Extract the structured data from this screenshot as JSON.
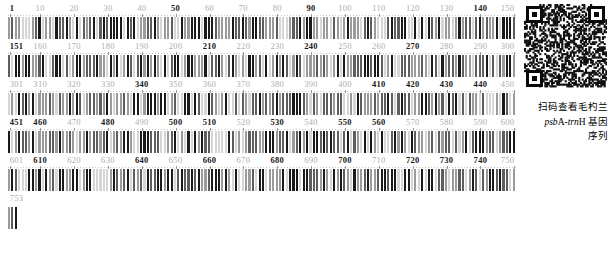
{
  "figure": {
    "type": "dna-barcode-sequence",
    "sequence_length": 754,
    "bases_per_row": 150,
    "rows": [
      {
        "start": 1,
        "end": 150,
        "ticks": [
          {
            "v": "1",
            "pos": 1,
            "strong": true
          },
          {
            "v": "10",
            "pos": 10,
            "strong": false
          },
          {
            "v": "20",
            "pos": 20,
            "strong": false
          },
          {
            "v": "30",
            "pos": 30,
            "strong": false
          },
          {
            "v": "40",
            "pos": 40,
            "strong": false
          },
          {
            "v": "50",
            "pos": 50,
            "strong": true
          },
          {
            "v": "60",
            "pos": 60,
            "strong": false
          },
          {
            "v": "70",
            "pos": 70,
            "strong": false
          },
          {
            "v": "80",
            "pos": 80,
            "strong": false
          },
          {
            "v": "90",
            "pos": 90,
            "strong": true
          },
          {
            "v": "100",
            "pos": 100,
            "strong": false
          },
          {
            "v": "110",
            "pos": 110,
            "strong": false
          },
          {
            "v": "120",
            "pos": 120,
            "strong": false
          },
          {
            "v": "130",
            "pos": 130,
            "strong": false
          },
          {
            "v": "140",
            "pos": 140,
            "strong": true
          },
          {
            "v": "150",
            "pos": 150,
            "strong": false
          }
        ]
      },
      {
        "start": 151,
        "end": 300,
        "ticks": [
          {
            "v": "151",
            "pos": 1,
            "strong": true
          },
          {
            "v": "160",
            "pos": 10,
            "strong": false
          },
          {
            "v": "170",
            "pos": 20,
            "strong": false
          },
          {
            "v": "180",
            "pos": 30,
            "strong": false
          },
          {
            "v": "190",
            "pos": 40,
            "strong": false
          },
          {
            "v": "200",
            "pos": 50,
            "strong": false
          },
          {
            "v": "210",
            "pos": 60,
            "strong": true
          },
          {
            "v": "220",
            "pos": 70,
            "strong": false
          },
          {
            "v": "230",
            "pos": 80,
            "strong": false
          },
          {
            "v": "240",
            "pos": 90,
            "strong": true
          },
          {
            "v": "250",
            "pos": 100,
            "strong": false
          },
          {
            "v": "260",
            "pos": 110,
            "strong": false
          },
          {
            "v": "270",
            "pos": 120,
            "strong": true
          },
          {
            "v": "280",
            "pos": 130,
            "strong": false
          },
          {
            "v": "290",
            "pos": 140,
            "strong": false
          },
          {
            "v": "300",
            "pos": 150,
            "strong": false
          }
        ]
      },
      {
        "start": 301,
        "end": 450,
        "ticks": [
          {
            "v": "301",
            "pos": 1,
            "strong": false
          },
          {
            "v": "310",
            "pos": 10,
            "strong": false
          },
          {
            "v": "320",
            "pos": 20,
            "strong": false
          },
          {
            "v": "330",
            "pos": 30,
            "strong": false
          },
          {
            "v": "340",
            "pos": 40,
            "strong": true
          },
          {
            "v": "350",
            "pos": 50,
            "strong": false
          },
          {
            "v": "360",
            "pos": 60,
            "strong": false
          },
          {
            "v": "370",
            "pos": 70,
            "strong": false
          },
          {
            "v": "380",
            "pos": 80,
            "strong": false
          },
          {
            "v": "390",
            "pos": 90,
            "strong": false
          },
          {
            "v": "400",
            "pos": 100,
            "strong": false
          },
          {
            "v": "410",
            "pos": 110,
            "strong": true
          },
          {
            "v": "420",
            "pos": 120,
            "strong": true
          },
          {
            "v": "430",
            "pos": 130,
            "strong": true
          },
          {
            "v": "440",
            "pos": 140,
            "strong": true
          },
          {
            "v": "450",
            "pos": 150,
            "strong": false
          }
        ]
      },
      {
        "start": 451,
        "end": 600,
        "ticks": [
          {
            "v": "451",
            "pos": 1,
            "strong": true
          },
          {
            "v": "460",
            "pos": 10,
            "strong": true
          },
          {
            "v": "470",
            "pos": 20,
            "strong": false
          },
          {
            "v": "480",
            "pos": 30,
            "strong": true
          },
          {
            "v": "490",
            "pos": 40,
            "strong": false
          },
          {
            "v": "500",
            "pos": 50,
            "strong": true
          },
          {
            "v": "510",
            "pos": 60,
            "strong": true
          },
          {
            "v": "520",
            "pos": 70,
            "strong": false
          },
          {
            "v": "530",
            "pos": 80,
            "strong": true
          },
          {
            "v": "540",
            "pos": 90,
            "strong": false
          },
          {
            "v": "550",
            "pos": 100,
            "strong": true
          },
          {
            "v": "560",
            "pos": 110,
            "strong": true
          },
          {
            "v": "570",
            "pos": 120,
            "strong": false
          },
          {
            "v": "580",
            "pos": 130,
            "strong": false
          },
          {
            "v": "590",
            "pos": 140,
            "strong": false
          },
          {
            "v": "600",
            "pos": 150,
            "strong": false
          }
        ]
      },
      {
        "start": 601,
        "end": 750,
        "ticks": [
          {
            "v": "601",
            "pos": 1,
            "strong": false
          },
          {
            "v": "610",
            "pos": 10,
            "strong": true
          },
          {
            "v": "620",
            "pos": 20,
            "strong": false
          },
          {
            "v": "630",
            "pos": 30,
            "strong": false
          },
          {
            "v": "640",
            "pos": 40,
            "strong": true
          },
          {
            "v": "650",
            "pos": 50,
            "strong": false
          },
          {
            "v": "660",
            "pos": 60,
            "strong": true
          },
          {
            "v": "670",
            "pos": 70,
            "strong": false
          },
          {
            "v": "680",
            "pos": 80,
            "strong": true
          },
          {
            "v": "690",
            "pos": 90,
            "strong": false
          },
          {
            "v": "700",
            "pos": 100,
            "strong": true
          },
          {
            "v": "710",
            "pos": 110,
            "strong": false
          },
          {
            "v": "720",
            "pos": 120,
            "strong": true
          },
          {
            "v": "730",
            "pos": 130,
            "strong": true
          },
          {
            "v": "740",
            "pos": 140,
            "strong": true
          },
          {
            "v": "750",
            "pos": 150,
            "strong": false
          }
        ]
      },
      {
        "start": 753,
        "end": 754,
        "ticks": [
          {
            "v": "753",
            "pos": 1,
            "strong": false
          }
        ]
      }
    ],
    "row_bar_counts": [
      150,
      150,
      150,
      150,
      150,
      3
    ],
    "base_colors": {
      "A": "#1a1a1a",
      "T": "#5e5e5e",
      "G": "#9b9b9b",
      "C": "#d6d6d6"
    },
    "label_color": "#aeaeae",
    "label_color_strong": "#1a1a1a"
  },
  "qr": {
    "name": "qr-code",
    "caption_lines": [
      "扫码查看毛杓兰",
      "psbA-trnH 基因",
      "序列"
    ],
    "caption_line2": {
      "italic_a": "psb",
      "plain_a": "A-",
      "italic_b": "trn",
      "plain_b": "H 基因"
    }
  }
}
